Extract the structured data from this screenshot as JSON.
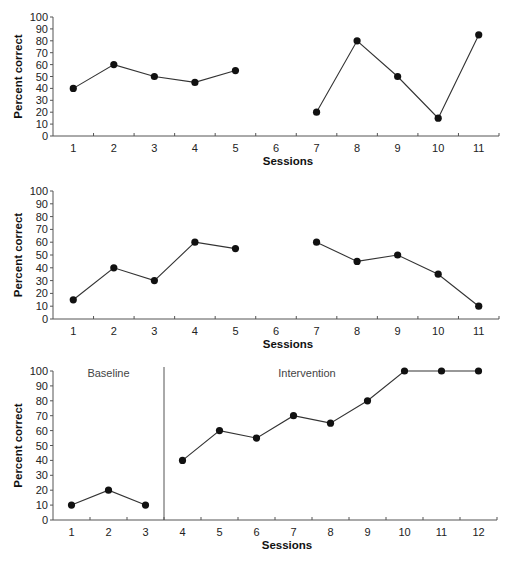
{
  "chart_data": [
    {
      "type": "line",
      "title": "",
      "xlabel": "Sessions",
      "ylabel": "Percent correct",
      "ylim": [
        0,
        100
      ],
      "yticks": [
        "0",
        "10",
        "20",
        "30",
        "40",
        "50",
        "60",
        "70",
        "80",
        "90",
        "100"
      ],
      "categories": [
        "1",
        "2",
        "3",
        "4",
        "5",
        "6",
        "7",
        "8",
        "9",
        "10",
        "11"
      ],
      "grid": false,
      "segments": [
        {
          "x": [
            1,
            2,
            3,
            4,
            5
          ],
          "y": [
            40,
            60,
            50,
            45,
            55
          ]
        },
        {
          "x": [
            7,
            8,
            9,
            10,
            11
          ],
          "y": [
            20,
            80,
            50,
            15,
            85
          ]
        }
      ]
    },
    {
      "type": "line",
      "title": "",
      "xlabel": "Sessions",
      "ylabel": "Percent correct",
      "ylim": [
        0,
        100
      ],
      "yticks": [
        "0",
        "10",
        "20",
        "30",
        "40",
        "50",
        "60",
        "70",
        "80",
        "90",
        "100"
      ],
      "categories": [
        "1",
        "2",
        "3",
        "4",
        "5",
        "6",
        "7",
        "8",
        "9",
        "10",
        "11"
      ],
      "grid": false,
      "segments": [
        {
          "x": [
            1,
            2,
            3,
            4,
            5
          ],
          "y": [
            15,
            40,
            30,
            60,
            55
          ]
        },
        {
          "x": [
            7,
            8,
            9,
            10,
            11
          ],
          "y": [
            60,
            45,
            50,
            35,
            10
          ]
        }
      ]
    },
    {
      "type": "line",
      "title": "",
      "xlabel": "Sessions",
      "ylabel": "Percent correct",
      "ylim": [
        0,
        100
      ],
      "yticks": [
        "0",
        "10",
        "20",
        "30",
        "40",
        "50",
        "60",
        "70",
        "80",
        "90",
        "100"
      ],
      "categories": [
        "1",
        "2",
        "3",
        "4",
        "5",
        "6",
        "7",
        "8",
        "9",
        "10",
        "11",
        "12"
      ],
      "grid": false,
      "phase_change_after": 3.5,
      "phases": [
        "Baseline",
        "Intervention"
      ],
      "segments": [
        {
          "x": [
            1,
            2,
            3
          ],
          "y": [
            10,
            20,
            10
          ]
        },
        {
          "x": [
            4,
            5,
            6,
            7,
            8,
            9,
            10,
            11,
            12
          ],
          "y": [
            40,
            60,
            55,
            70,
            65,
            80,
            100,
            100,
            100
          ]
        }
      ]
    }
  ]
}
